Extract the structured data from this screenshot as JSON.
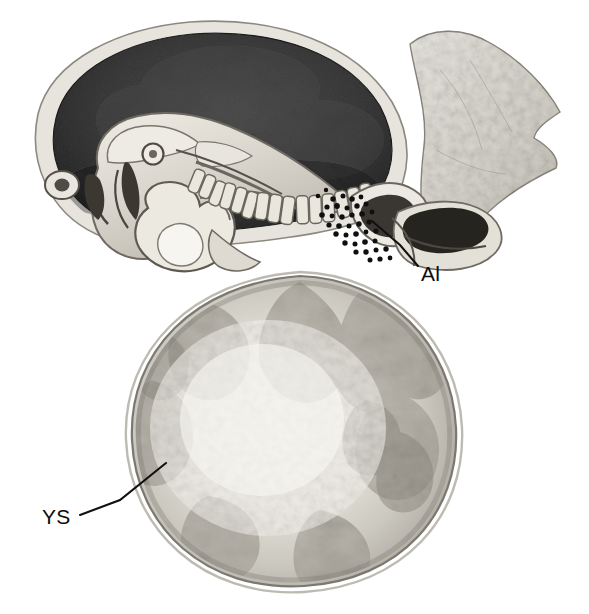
{
  "figure": {
    "kind": "anatomical-illustration",
    "background_color": "#ffffff",
    "width": 589,
    "height": 614
  },
  "labels": [
    {
      "id": "allantois",
      "text": "Al",
      "meaning": "Allantois",
      "text_x": 421,
      "text_y": 281,
      "leader": [
        [
          418,
          266
        ],
        [
          400,
          245
        ],
        [
          372,
          221
        ]
      ],
      "color": "#0d0d0d"
    },
    {
      "id": "yolk-sac",
      "text": "YS",
      "meaning": "Yolk sac",
      "text_x": 42,
      "text_y": 524,
      "leader": [
        [
          80,
          515
        ],
        [
          120,
          500
        ],
        [
          166,
          463
        ]
      ],
      "color": "#0d0d0d"
    }
  ],
  "structures": [
    {
      "id": "amniotic-cavity",
      "name": "Amniotic cavity",
      "tone": "#3a3a3a",
      "description": "Large dark crescent-shaped cavity in the upper portion"
    },
    {
      "id": "amnion",
      "name": "Amnion membrane",
      "tone": "#d8d6d0",
      "description": "Thin pale rim bounding the amniotic cavity"
    },
    {
      "id": "embryo",
      "name": "Embryo",
      "tone": "#cfcbc2",
      "description": "Curved embryo at left with brain vesicles, heart and somites"
    },
    {
      "id": "somites",
      "name": "Somites",
      "tone": "#e2ded5",
      "description": "Row of segmented blocks along the embryonic axis"
    },
    {
      "id": "heart",
      "name": "Heart",
      "tone": "#efece4",
      "description": "Pale bulbous structure ventral to the embryo head"
    },
    {
      "id": "yolk-sac",
      "name": "Yolk sac",
      "tone": "#c9c6bd",
      "description": "Large mottled sphere occupying the lower two-thirds"
    },
    {
      "id": "allantois",
      "name": "Allantois",
      "tone": "#2c2c2c",
      "description": "Dark elongated diverticulum at right, labelled Al"
    },
    {
      "id": "chorion",
      "name": "Chorion / trophoblast",
      "tone": "#dedbd4",
      "description": "Pale irregular tissue flaring to the upper right"
    },
    {
      "id": "germ-cells",
      "name": "Migrating cells",
      "tone": "#111111",
      "description": "Stippled dark dots between the hindgut and yolk sac"
    }
  ],
  "colors": {
    "ink": "#0d0d0d",
    "amnion_cavity": "#3a3a3a",
    "yolk_sac_fill": "#c9c6bd",
    "chorion_fill": "#dedbd4",
    "outline": "#4a4741"
  }
}
